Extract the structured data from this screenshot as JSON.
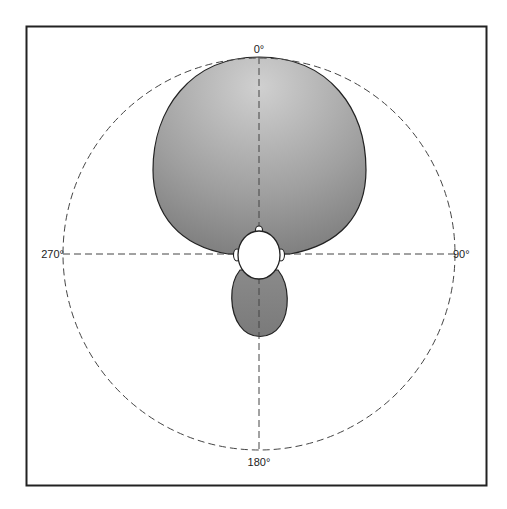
{
  "diagram": {
    "type": "polar-pickup-pattern",
    "labels": {
      "top": "0°",
      "right": "90°",
      "bottom": "180°",
      "left": "270°"
    },
    "colors": {
      "frame": "#222222",
      "lobe_fill_light": "#c8c8c8",
      "lobe_fill_dark": "#7a7a7a",
      "lobe_stroke": "#222222",
      "dashed_lines": "#444444",
      "head_fill": "#ffffff"
    },
    "components": [
      "front-lobe",
      "rear-lobe",
      "listener-head",
      "reference-circle",
      "axis-lines"
    ]
  }
}
